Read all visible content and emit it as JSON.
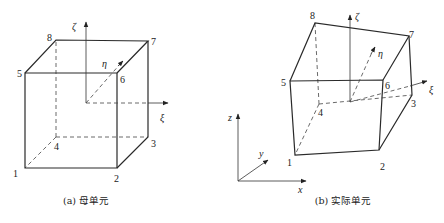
{
  "figure": {
    "panels": [
      {
        "id": "a",
        "caption": "(a) 母单元",
        "vertices": [
          {
            "label": "1",
            "x": 25,
            "y": 168
          },
          {
            "label": "2",
            "x": 117,
            "y": 168
          },
          {
            "label": "3",
            "x": 148,
            "y": 137
          },
          {
            "label": "4",
            "x": 56,
            "y": 137
          },
          {
            "label": "5",
            "x": 25,
            "y": 73
          },
          {
            "label": "6",
            "x": 117,
            "y": 73
          },
          {
            "label": "7",
            "x": 148,
            "y": 41
          },
          {
            "label": "8",
            "x": 56,
            "y": 40
          }
        ],
        "local_axes": {
          "origin": {
            "x": 86,
            "y": 103
          },
          "zeta": {
            "label": "ζ",
            "x": 86,
            "y": 21
          },
          "xi": {
            "label": "ξ",
            "x": 168,
            "y": 103
          },
          "eta": {
            "label": "η",
            "x": 123,
            "y": 61
          }
        }
      },
      {
        "id": "b",
        "caption": "(b) 实际单元",
        "vertices": [
          {
            "label": "1",
            "x": 295,
            "y": 155
          },
          {
            "label": "2",
            "x": 379,
            "y": 150
          },
          {
            "label": "3",
            "x": 412,
            "y": 95
          },
          {
            "label": "4",
            "x": 319,
            "y": 104
          },
          {
            "label": "5",
            "x": 290,
            "y": 81
          },
          {
            "label": "6",
            "x": 383,
            "y": 80
          },
          {
            "label": "7",
            "x": 409,
            "y": 36
          },
          {
            "label": "8",
            "x": 315,
            "y": 23
          }
        ],
        "local_axes": {
          "origin": {
            "x": 350,
            "y": 102
          },
          "zeta": {
            "label": "ζ",
            "x": 350,
            "y": 14
          },
          "xi": {
            "label": "ξ",
            "x": 427,
            "y": 80
          },
          "eta": {
            "label": "η",
            "x": 375,
            "y": 47
          }
        },
        "global_axes": {
          "origin": {
            "x": 238,
            "y": 181
          },
          "z": {
            "label": "z",
            "x": 238,
            "y": 114
          },
          "x": {
            "label": "x",
            "x": 306,
            "y": 181
          },
          "y": {
            "label": "y",
            "x": 268,
            "y": 160
          }
        }
      }
    ]
  }
}
